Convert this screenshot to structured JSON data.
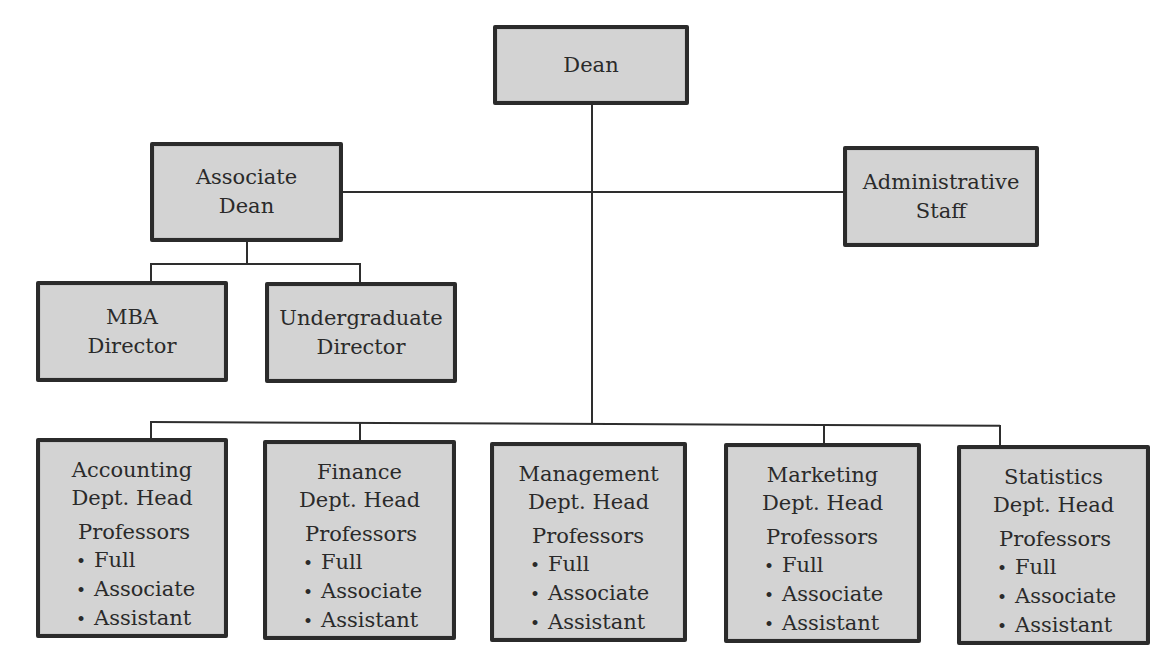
{
  "chart": {
    "dean": {
      "label": "Dean"
    },
    "associate_dean": {
      "line1": "Associate",
      "line2": "Dean"
    },
    "admin_staff": {
      "line1": "Administrative",
      "line2": "Staff"
    },
    "mba_director": {
      "line1": "MBA",
      "line2": "Director"
    },
    "undergrad_director": {
      "line1": "Undergraduate",
      "line2": "Director"
    },
    "departments": [
      {
        "name": "Accounting",
        "head": "Dept. Head",
        "staff_label": "Professors",
        "ranks": [
          "Full",
          "Associate",
          "Assistant"
        ]
      },
      {
        "name": "Finance",
        "head": "Dept. Head",
        "staff_label": "Professors",
        "ranks": [
          "Full",
          "Associate",
          "Assistant"
        ]
      },
      {
        "name": "Management",
        "head": "Dept. Head",
        "staff_label": "Professors",
        "ranks": [
          "Full",
          "Associate",
          "Assistant"
        ]
      },
      {
        "name": "Marketing",
        "head": "Dept. Head",
        "staff_label": "Professors",
        "ranks": [
          "Full",
          "Associate",
          "Assistant"
        ]
      },
      {
        "name": "Statistics",
        "head": "Dept. Head",
        "staff_label": "Professors",
        "ranks": [
          "Full",
          "Associate",
          "Assistant"
        ]
      }
    ]
  },
  "colors": {
    "box_fill": "#d3d3d3",
    "box_border": "#2b2b2b",
    "line": "#2e2e2e"
  }
}
